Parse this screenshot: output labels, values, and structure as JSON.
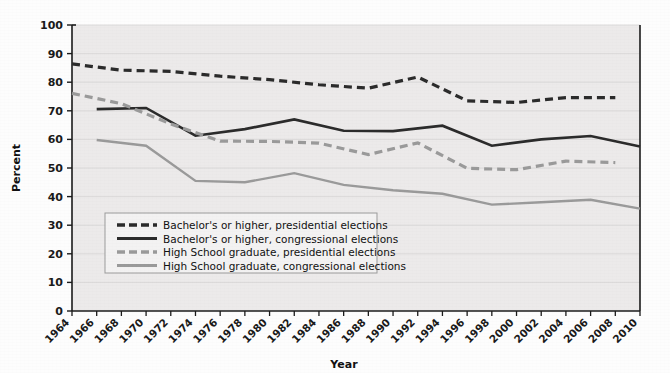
{
  "chart_data": {
    "type": "line",
    "title": "",
    "subtitle": "",
    "xlabel": "Year",
    "ylabel": "Percent",
    "ylim": [
      0,
      100
    ],
    "ytick_step": 10,
    "yticks": [
      0,
      10,
      20,
      30,
      40,
      50,
      60,
      70,
      80,
      90,
      100
    ],
    "grid": true,
    "legend_position": "lower-left-inside",
    "x": [
      1964,
      1966,
      1968,
      1970,
      1972,
      1974,
      1976,
      1978,
      1980,
      1982,
      1984,
      1986,
      1988,
      1990,
      1992,
      1994,
      1996,
      1998,
      2000,
      2002,
      2004,
      2006,
      2008,
      2010
    ],
    "categories": [
      "1964",
      "1966",
      "1968",
      "1970",
      "1972",
      "1974",
      "1976",
      "1978",
      "1980",
      "1982",
      "1984",
      "1986",
      "1988",
      "1990",
      "1992",
      "1994",
      "1996",
      "1998",
      "2000",
      "2002",
      "2004",
      "2006",
      "2008",
      "2010"
    ],
    "series": [
      {
        "name": "Bachelor's or higher, presidential elections",
        "style": "dashed",
        "color": "#2b2b2b",
        "x": [
          1964,
          1968,
          1972,
          1976,
          1980,
          1984,
          1988,
          1992,
          1996,
          2000,
          2004,
          2008
        ],
        "values": [
          86.4,
          84.2,
          83.8,
          82.1,
          80.9,
          79.1,
          77.9,
          81.8,
          73.5,
          72.9,
          74.6,
          74.6
        ]
      },
      {
        "name": "Bachelor's or higher, congressional elections",
        "style": "solid",
        "color": "#2b2b2b",
        "x": [
          1966,
          1970,
          1974,
          1978,
          1982,
          1986,
          1990,
          1994,
          1998,
          2002,
          2006,
          2010
        ],
        "values": [
          70.6,
          71.0,
          61.3,
          63.6,
          67.0,
          63.0,
          62.9,
          64.8,
          57.8,
          60.0,
          61.2,
          57.5
        ]
      },
      {
        "name": "High School graduate, presidential elections",
        "style": "dashed",
        "color": "#9a9a9a",
        "x": [
          1964,
          1968,
          1972,
          1976,
          1980,
          1984,
          1988,
          1992,
          1996,
          2000,
          2004,
          2008
        ],
        "values": [
          76.1,
          72.5,
          65.4,
          59.4,
          59.3,
          58.7,
          54.7,
          58.8,
          49.9,
          49.4,
          52.4,
          51.9
        ]
      },
      {
        "name": "High School graduate, congressional elections",
        "style": "solid",
        "color": "#9a9a9a",
        "x": [
          1966,
          1970,
          1974,
          1978,
          1982,
          1986,
          1990,
          1994,
          1998,
          2002,
          2006,
          2010
        ],
        "values": [
          59.8,
          57.8,
          45.5,
          45.0,
          48.2,
          44.1,
          42.2,
          41.0,
          37.2,
          38.0,
          38.9,
          35.8
        ]
      }
    ],
    "legend": [
      {
        "label": "Bachelor's or higher, presidential elections",
        "style": "dashed",
        "color": "#2b2b2b"
      },
      {
        "label": "Bachelor's or higher, congressional elections",
        "style": "solid",
        "color": "#2b2b2b"
      },
      {
        "label": "High School graduate, presidential elections",
        "style": "dashed",
        "color": "#9a9a9a"
      },
      {
        "label": "High School graduate, congressional elections",
        "style": "solid",
        "color": "#9a9a9a"
      }
    ]
  },
  "colors": {
    "plot_background": "#eceaea",
    "page_background": "#fdfdfd",
    "axis": "#1b1b1b",
    "grid": "#d6d4d4",
    "dark_series": "#2b2b2b",
    "light_series": "#9a9a9a",
    "legend_background": "#f3f2f2",
    "legend_border": "#9b9b9b"
  }
}
